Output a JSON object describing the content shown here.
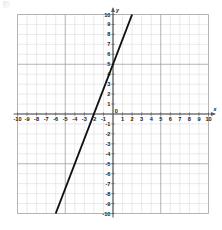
{
  "chart_data": {
    "type": "line",
    "title": "",
    "subtitle": "",
    "xlabel": "x",
    "ylabel": "y",
    "xlim": [
      -10,
      10
    ],
    "ylim": [
      -10,
      10
    ],
    "grid": true,
    "grid_step": 1,
    "legend": "none",
    "x_ticks": [
      -10,
      -9,
      -8,
      -7,
      -6,
      -5,
      -4,
      -3,
      -2,
      -1,
      0,
      1,
      2,
      3,
      4,
      5,
      6,
      7,
      8,
      9,
      10
    ],
    "y_ticks": [
      -10,
      -9,
      -8,
      -7,
      -6,
      -5,
      -4,
      -3,
      -2,
      -1,
      0,
      1,
      2,
      3,
      4,
      5,
      6,
      7,
      8,
      9,
      10
    ],
    "x_tick_labels": [
      "-10",
      "-9",
      "-8",
      "-7",
      "-6",
      "-5",
      "-4",
      "-3",
      "-2",
      "-1",
      "0",
      "1",
      "2",
      "3",
      "4",
      "5",
      "6",
      "7",
      "8",
      "9",
      "10"
    ],
    "y_tick_labels": [
      "-10",
      "-9",
      "-8",
      "-7",
      "-6",
      "-5",
      "-4",
      "-3",
      "-2",
      "-1",
      "0",
      "1",
      "2",
      "3",
      "4",
      "5",
      "6",
      "7",
      "8",
      "9",
      "10"
    ],
    "origin_label": "0",
    "series": [
      {
        "name": "line",
        "equation": "y = 2.5x + 5",
        "slope": 2.5,
        "y_intercept": 5,
        "x_intercept": -2,
        "color": "#111111",
        "x": [
          -6,
          2
        ],
        "y": [
          -10,
          10
        ],
        "points": [
          {
            "x": -6,
            "y": -10
          },
          {
            "x": -2,
            "y": 0
          },
          {
            "x": 0,
            "y": 5
          },
          {
            "x": 2,
            "y": 10
          }
        ]
      }
    ],
    "colors": {
      "minor_grid": "#d8d8d8",
      "major_grid": "#9a9aa0",
      "axis": "#58585e",
      "line": "#111111",
      "background": "#ffffff",
      "label": "#1a1a1a"
    }
  }
}
